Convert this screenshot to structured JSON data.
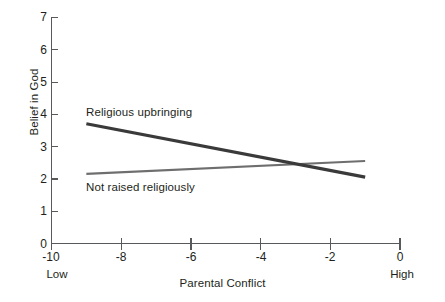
{
  "chart_data": {
    "type": "line",
    "title": "",
    "subtitle": "",
    "xlabel": "Parental Conflict",
    "ylabel": "Belief in God",
    "xlim": [
      -10,
      0
    ],
    "ylim": [
      0,
      7
    ],
    "grid": false,
    "legend_position": "inline-annotations",
    "x_ticks": [
      "-10",
      "-8",
      "-6",
      "-4",
      "-2",
      "0"
    ],
    "x_tick_values": [
      -10,
      -8,
      -6,
      -4,
      -2,
      0
    ],
    "y_ticks": [
      "0",
      "1",
      "2",
      "3",
      "4",
      "5",
      "6",
      "7"
    ],
    "y_tick_values": [
      0,
      1,
      2,
      3,
      4,
      5,
      6,
      7
    ],
    "x_axis_endpoint_labels": {
      "low": "Low",
      "high": "High"
    },
    "series": [
      {
        "name": "Religious upbringing",
        "color": "#3a3a3a",
        "width": 3.2,
        "x": [
          -9,
          -1
        ],
        "values": [
          3.7,
          2.05
        ]
      },
      {
        "name": "Not raised religiously",
        "color": "#6e6e6e",
        "width": 2.2,
        "x": [
          -9,
          -1
        ],
        "values": [
          2.15,
          2.55
        ]
      }
    ],
    "annotations": [
      {
        "text": "Religious upbringing",
        "x": -8.8,
        "y": 4.05
      },
      {
        "text": "Not raised religiously",
        "x": -8.8,
        "y": 1.85
      }
    ],
    "intersection": {
      "x": -2.7,
      "y": 2.4
    }
  },
  "axis_colors": {
    "axis_line": "#58595b",
    "text": "#231f20"
  }
}
